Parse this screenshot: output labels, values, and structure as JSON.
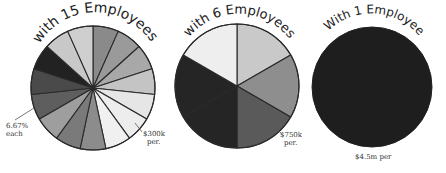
{
  "chart_data": [
    {
      "type": "pie",
      "title": "With 15 Employees",
      "slices": 15,
      "share_each_percent": 6.67,
      "annotations": [
        "6.67% each",
        "$300k per"
      ],
      "colors": [
        "#8a8a8a",
        "#9a9a9a",
        "#a8a8a8",
        "#c4c4c4",
        "#e6e6e6",
        "#ededed",
        "#f0f0f0",
        "#8c8c8c",
        "#7a7a7a",
        "#9e9e9e",
        "#5e5e5e",
        "#4a4a4a",
        "#222222",
        "#c8c8c8",
        "#cfcfcf"
      ],
      "values": [
        6.67,
        6.67,
        6.67,
        6.67,
        6.67,
        6.67,
        6.67,
        6.67,
        6.67,
        6.67,
        6.67,
        6.67,
        6.67,
        6.67,
        6.67
      ]
    },
    {
      "type": "pie",
      "title": "With 6 Employees",
      "slices": 6,
      "annotations": [
        "$750k per"
      ],
      "colors": [
        "#c9c9c9",
        "#8e8e8e",
        "#5a5a5a",
        "#252525",
        "#252525",
        "#eeeeee"
      ],
      "values": [
        16.67,
        16.67,
        16.67,
        16.67,
        16.67,
        16.67
      ]
    },
    {
      "type": "pie",
      "title": "With 1 Employee",
      "slices": 1,
      "annotations": [
        "$4.5m per"
      ],
      "colors": [
        "#1e1e1e"
      ],
      "values": [
        100
      ]
    }
  ],
  "labels": {
    "pie1_title": "with 15 Employees",
    "pie2_title": "with 6 Employees",
    "pie3_title": "With 1 Employee",
    "pie1_note_left_line1": "6.67%",
    "pie1_note_left_line2": "each",
    "pie1_note_right_line1": "$300k",
    "pie1_note_right_line2": "per.",
    "pie2_note_line1": "$750k",
    "pie2_note_line2": "per.",
    "pie3_note": "$4.5m per"
  }
}
